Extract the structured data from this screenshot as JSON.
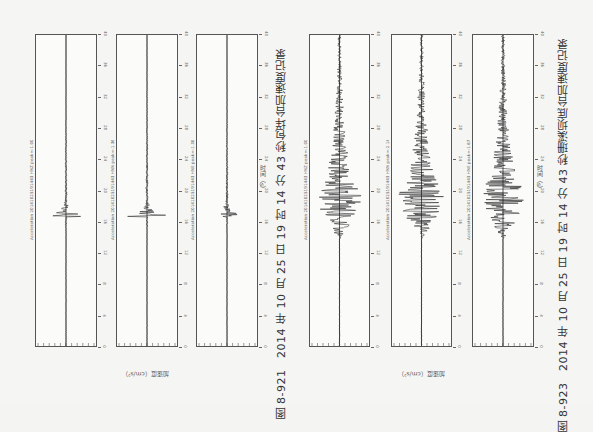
{
  "page": {
    "orientation": "rotated-90-clockwise"
  },
  "figures": [
    {
      "id": "fig-8-921",
      "caption": "图 8-921　2014 年 10 月 25 日 19 时 14 分 43 秒包垟台加速度记录",
      "time_axis_title": "时间（s）",
      "acc_axis_title": "加速度（cm/s²）",
      "time_ticks": [
        "0",
        "2",
        "4",
        "6",
        "8",
        "10",
        "12",
        "14",
        "16",
        "18",
        "20",
        "22",
        "24",
        "26",
        "28",
        "30",
        "32",
        "34",
        "36",
        "38",
        "40"
      ],
      "panels": [
        {
          "station_label": "Acceleration 20141025191443 HNZ  peak=-1.000",
          "event_pos": 0.585,
          "amplitude": 0.85,
          "coda": 0.15,
          "style": "spike"
        },
        {
          "station_label": "Acceleration 20141025191443 HNN  peak=-1.364",
          "event_pos": 0.585,
          "amplitude": 0.95,
          "coda": 0.2,
          "style": "spike"
        },
        {
          "station_label": "Acceleration 20141025191443 HNE  peak=-1.304",
          "event_pos": 0.585,
          "amplitude": 0.7,
          "coda": 0.15,
          "style": "spike"
        }
      ]
    },
    {
      "id": "fig-8-923",
      "caption": "图 8-923　2014 年 10 月 25 日 19 时 14 分 43 秒珊溪坝底台加速度记录",
      "time_axis_title": "时间（s）",
      "acc_axis_title": "加速度（cm/s²）",
      "time_ticks": [
        "0",
        "2",
        "4",
        "6",
        "8",
        "10",
        "12",
        "14",
        "16",
        "18",
        "20",
        "22",
        "24",
        "26",
        "28",
        "30",
        "32",
        "34",
        "36",
        "38",
        "40"
      ],
      "panels": [
        {
          "station_label": "Acceleration 20141025191443 HNZ  peak=-1.000",
          "event_pos": 0.6,
          "amplitude": 0.8,
          "coda": 0.55,
          "style": "burst"
        },
        {
          "station_label": "Acceleration 20141025191443 HNN  peak=-2.140",
          "event_pos": 0.6,
          "amplitude": 0.85,
          "coda": 0.55,
          "style": "burst"
        },
        {
          "station_label": "Acceleration 20141025191443 HNE  peak=-1.673",
          "event_pos": 0.6,
          "amplitude": 0.8,
          "coda": 0.55,
          "style": "burst"
        }
      ]
    }
  ],
  "colors": {
    "paper": "#f5f5f3",
    "ink": "#222222",
    "frame": "#555555"
  }
}
